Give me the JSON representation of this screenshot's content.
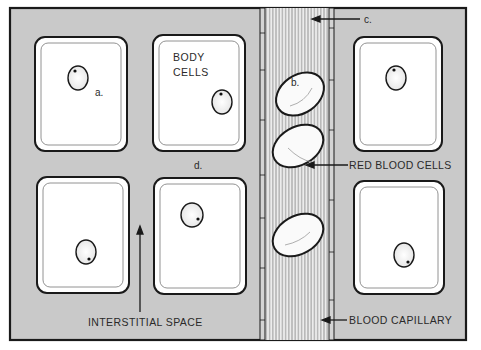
{
  "diagram": {
    "type": "biology-illustration",
    "colors": {
      "interstitial": "#c9c9c9",
      "cell_fill": "#ffffff",
      "outline": "#1a1a1a",
      "capillary_bg": "#e6e6e6",
      "text": "#2a2a2a"
    },
    "labels": {
      "a": "a.",
      "b": "b.",
      "c": "c.",
      "d": "d.",
      "body_cells_line1": "BODY",
      "body_cells_line2": "CELLS",
      "red_blood_cells": "RED BLOOD CELLS",
      "interstitial_space": "INTERSTITIAL SPACE",
      "blood_capillary": "BLOOD CAPILLARY"
    },
    "body_cells": [
      {
        "id": "top-left",
        "x": 35,
        "y": 37,
        "w": 92,
        "h": 114
      },
      {
        "id": "top-middle",
        "x": 153,
        "y": 35,
        "w": 92,
        "h": 116
      },
      {
        "id": "bottom-left",
        "x": 37,
        "y": 177,
        "w": 92,
        "h": 116
      },
      {
        "id": "bottom-middle",
        "x": 154,
        "y": 178,
        "w": 92,
        "h": 116
      },
      {
        "id": "top-right",
        "x": 354,
        "y": 37,
        "w": 88,
        "h": 114
      },
      {
        "id": "bottom-right",
        "x": 354,
        "y": 181,
        "w": 90,
        "h": 113
      }
    ],
    "red_blood_cells": [
      {
        "cx": 300,
        "cy": 94,
        "rx": 26,
        "ry": 19,
        "rot": -35
      },
      {
        "cx": 298,
        "cy": 146,
        "rx": 27,
        "ry": 19,
        "rot": -30
      },
      {
        "cx": 298,
        "cy": 235,
        "rx": 27,
        "ry": 19,
        "rot": -30
      }
    ]
  }
}
